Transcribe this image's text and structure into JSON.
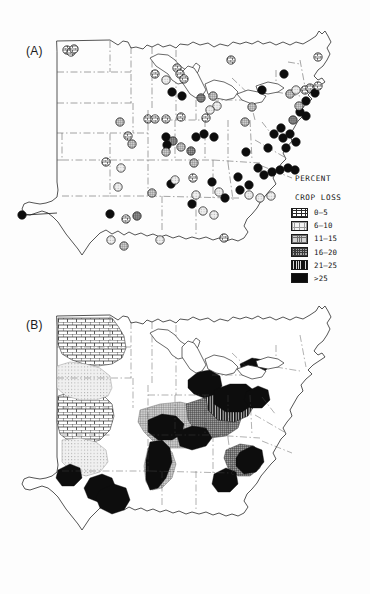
{
  "figure": {
    "caption_a": "(A)",
    "caption_b": "(B)",
    "region": "Eastern and central United States"
  },
  "legend": {
    "title": "PERCENT\nCROP LOSS",
    "title_line1": "PERCENT",
    "title_line2": "CROP LOSS",
    "classes": [
      {
        "label": "0–5",
        "swatch": "brick-pattern",
        "min": 0,
        "max": 5
      },
      {
        "label": "6–10",
        "swatch": "light-dot-pattern",
        "min": 6,
        "max": 10
      },
      {
        "label": "11–15",
        "swatch": "medium-grid-pattern",
        "min": 11,
        "max": 15
      },
      {
        "label": "16–20",
        "swatch": "dark-grid-pattern",
        "min": 16,
        "max": 20
      },
      {
        "label": "21–25",
        "swatch": "vertical-line-pattern",
        "min": 21,
        "max": 25
      },
      {
        "label": ">25",
        "swatch": "solid-black",
        "min": 25,
        "max": null
      }
    ]
  },
  "chart_data": {
    "type": "map",
    "title": "Percent crop loss",
    "subtitle": "",
    "xlabel": "",
    "ylabel": "",
    "panels": [
      {
        "id": "A",
        "label": "(A)",
        "kind": "point-symbol-map",
        "description": "Observed percent crop loss at individual sampling sites, plotted as shaded circles",
        "points": [
          {
            "x": 67,
            "y": 50,
            "class": 0
          },
          {
            "x": 71,
            "y": 52,
            "class": 0
          },
          {
            "x": 74,
            "y": 49,
            "class": 0
          },
          {
            "x": 155,
            "y": 74,
            "class": 0
          },
          {
            "x": 177,
            "y": 68,
            "class": 0
          },
          {
            "x": 180,
            "y": 74,
            "class": 0
          },
          {
            "x": 184,
            "y": 79,
            "class": 0
          },
          {
            "x": 166,
            "y": 80,
            "class": 1
          },
          {
            "x": 172,
            "y": 92,
            "class": 5
          },
          {
            "x": 182,
            "y": 96,
            "class": 5
          },
          {
            "x": 201,
            "y": 98,
            "class": 3
          },
          {
            "x": 213,
            "y": 96,
            "class": 2
          },
          {
            "x": 217,
            "y": 106,
            "class": 1
          },
          {
            "x": 210,
            "y": 110,
            "class": 1
          },
          {
            "x": 120,
            "y": 122,
            "class": 2
          },
          {
            "x": 128,
            "y": 136,
            "class": 0
          },
          {
            "x": 148,
            "y": 119,
            "class": 0
          },
          {
            "x": 155,
            "y": 119,
            "class": 0
          },
          {
            "x": 166,
            "y": 119,
            "class": 0
          },
          {
            "x": 181,
            "y": 117,
            "class": 0
          },
          {
            "x": 206,
            "y": 118,
            "class": 0
          },
          {
            "x": 245,
            "y": 122,
            "class": 2
          },
          {
            "x": 166,
            "y": 137,
            "class": 5
          },
          {
            "x": 173,
            "y": 141,
            "class": 3
          },
          {
            "x": 196,
            "y": 137,
            "class": 5
          },
          {
            "x": 204,
            "y": 134,
            "class": 5
          },
          {
            "x": 214,
            "y": 137,
            "class": 5
          },
          {
            "x": 167,
            "y": 145,
            "class": 5
          },
          {
            "x": 166,
            "y": 152,
            "class": 2
          },
          {
            "x": 181,
            "y": 147,
            "class": 2
          },
          {
            "x": 191,
            "y": 151,
            "class": 3
          },
          {
            "x": 132,
            "y": 144,
            "class": 2
          },
          {
            "x": 194,
            "y": 163,
            "class": 2
          },
          {
            "x": 246,
            "y": 152,
            "class": 5
          },
          {
            "x": 268,
            "y": 148,
            "class": 5
          },
          {
            "x": 106,
            "y": 162,
            "class": 0
          },
          {
            "x": 193,
            "y": 178,
            "class": 0
          },
          {
            "x": 118,
            "y": 187,
            "class": 1
          },
          {
            "x": 121,
            "y": 168,
            "class": 1
          },
          {
            "x": 171,
            "y": 184,
            "class": 5
          },
          {
            "x": 212,
            "y": 182,
            "class": 5
          },
          {
            "x": 238,
            "y": 177,
            "class": 5
          },
          {
            "x": 249,
            "y": 185,
            "class": 5
          },
          {
            "x": 240,
            "y": 190,
            "class": 5
          },
          {
            "x": 264,
            "y": 175,
            "class": 5
          },
          {
            "x": 272,
            "y": 172,
            "class": 5
          },
          {
            "x": 280,
            "y": 170,
            "class": 5
          },
          {
            "x": 288,
            "y": 168,
            "class": 5
          },
          {
            "x": 295,
            "y": 170,
            "class": 5
          },
          {
            "x": 258,
            "y": 168,
            "class": 5
          },
          {
            "x": 249,
            "y": 195,
            "class": 1
          },
          {
            "x": 260,
            "y": 198,
            "class": 1
          },
          {
            "x": 271,
            "y": 196,
            "class": 1
          },
          {
            "x": 152,
            "y": 193,
            "class": 2
          },
          {
            "x": 175,
            "y": 180,
            "class": 1
          },
          {
            "x": 196,
            "y": 195,
            "class": 1
          },
          {
            "x": 219,
            "y": 192,
            "class": 1
          },
          {
            "x": 192,
            "y": 204,
            "class": 5
          },
          {
            "x": 225,
            "y": 198,
            "class": 5
          },
          {
            "x": 203,
            "y": 211,
            "class": 1
          },
          {
            "x": 214,
            "y": 215,
            "class": 1
          },
          {
            "x": 110,
            "y": 214,
            "class": 5
          },
          {
            "x": 126,
            "y": 219,
            "class": 0
          },
          {
            "x": 137,
            "y": 216,
            "class": 3
          },
          {
            "x": 111,
            "y": 240,
            "class": 1
          },
          {
            "x": 124,
            "y": 246,
            "class": 2
          },
          {
            "x": 160,
            "y": 240,
            "class": 1
          },
          {
            "x": 224,
            "y": 238,
            "class": 0
          },
          {
            "x": 22,
            "y": 215,
            "class": 5
          },
          {
            "x": 281,
            "y": 128,
            "class": 5
          },
          {
            "x": 274,
            "y": 134,
            "class": 5
          },
          {
            "x": 283,
            "y": 138,
            "class": 5
          },
          {
            "x": 290,
            "y": 134,
            "class": 5
          },
          {
            "x": 296,
            "y": 142,
            "class": 5
          },
          {
            "x": 286,
            "y": 148,
            "class": 5
          },
          {
            "x": 293,
            "y": 120,
            "class": 3
          },
          {
            "x": 300,
            "y": 112,
            "class": 5
          },
          {
            "x": 306,
            "y": 116,
            "class": 5
          },
          {
            "x": 299,
            "y": 106,
            "class": 2
          },
          {
            "x": 290,
            "y": 94,
            "class": 2
          },
          {
            "x": 296,
            "y": 90,
            "class": 1
          },
          {
            "x": 305,
            "y": 90,
            "class": 0
          },
          {
            "x": 310,
            "y": 88,
            "class": 0
          },
          {
            "x": 315,
            "y": 93,
            "class": 5
          },
          {
            "x": 318,
            "y": 86,
            "class": 0
          },
          {
            "x": 284,
            "y": 74,
            "class": 5
          },
          {
            "x": 262,
            "y": 90,
            "class": 5
          },
          {
            "x": 252,
            "y": 107,
            "class": 2
          },
          {
            "x": 231,
            "y": 60,
            "class": 0
          },
          {
            "x": 318,
            "y": 57,
            "class": 0
          },
          {
            "x": 306,
            "y": 101,
            "class": 5
          }
        ]
      },
      {
        "id": "B",
        "label": "(B)",
        "kind": "isopleth-map",
        "description": "Interpolated contour regions of percent crop loss shaded by the same six classes",
        "regions": [
          {
            "class": 0,
            "name": "northern-great-plains-brick"
          },
          {
            "class": 0,
            "name": "central-great-plains-brick"
          },
          {
            "class": 1,
            "name": "western-dotted-band"
          },
          {
            "class": 1,
            "name": "southern-plains-dotted"
          },
          {
            "class": 2,
            "name": "ohio-valley-medium"
          },
          {
            "class": 3,
            "name": "appalachian-dark-grid"
          },
          {
            "class": 4,
            "name": "mid-atlantic-lines"
          },
          {
            "class": 5,
            "name": "northeast-corridor-solid"
          },
          {
            "class": 5,
            "name": "lower-michigan-solid"
          },
          {
            "class": 5,
            "name": "lake-erie-solid"
          },
          {
            "class": 5,
            "name": "illinois-indiana-solid"
          },
          {
            "class": 5,
            "name": "texas-gulf-solid"
          },
          {
            "class": 5,
            "name": "carolina-piedmont-solid"
          }
        ]
      }
    ]
  }
}
